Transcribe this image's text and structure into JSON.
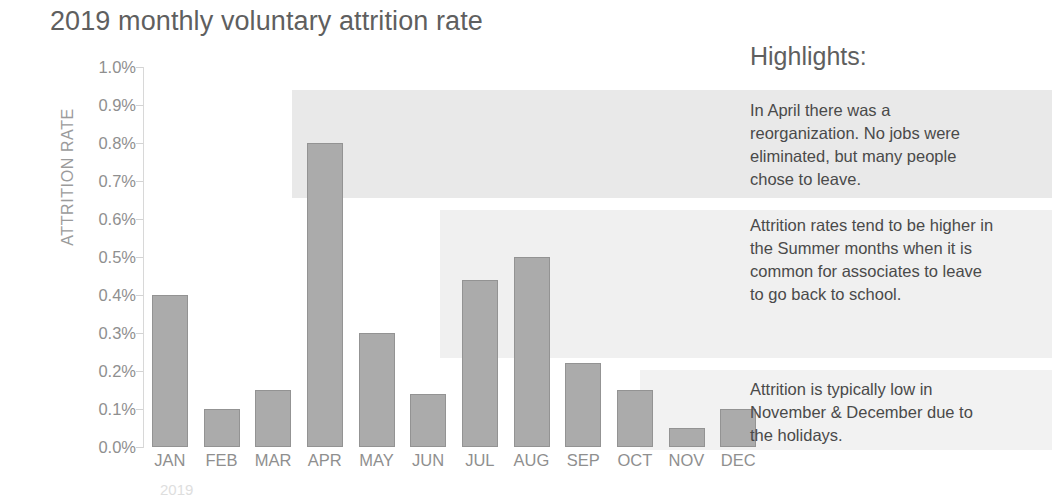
{
  "chart_data": {
    "type": "bar",
    "title": "2019 monthly voluntary attrition rate",
    "xlabel": "",
    "ylabel": "ATTRITION RATE",
    "categories": [
      "JAN",
      "FEB",
      "MAR",
      "APR",
      "MAY",
      "JUN",
      "JUL",
      "AUG",
      "SEP",
      "OCT",
      "NOV",
      "DEC"
    ],
    "values": [
      0.4,
      0.1,
      0.15,
      0.8,
      0.3,
      0.14,
      0.44,
      0.5,
      0.22,
      0.15,
      0.05,
      0.1
    ],
    "value_unit": "%",
    "ylim": [
      0.0,
      1.0
    ],
    "ytick_labels": [
      "1.0%",
      "0.9%",
      "0.8%",
      "0.7%",
      "0.6%",
      "0.5%",
      "0.4%",
      "0.3%",
      "0.2%",
      "0.1%",
      "0.0%"
    ],
    "ytick_values": [
      1.0,
      0.9,
      0.8,
      0.7,
      0.6,
      0.5,
      0.4,
      0.3,
      0.2,
      0.1,
      0.0
    ],
    "grid": false,
    "legend": false,
    "bar_color": "#ababab",
    "bar_border_color": "#939393",
    "footnote": "2019"
  },
  "highlights": {
    "title": "Highlights:",
    "items": [
      {
        "text": "In April there was a reorganization. No jobs were eliminated, but many people chose to leave.",
        "band_color": "#e9e9e9"
      },
      {
        "text": "Attrition rates tend to be higher in the Summer months when it is common for associates to leave to go back to school.",
        "band_color": "#f0f0f0"
      },
      {
        "text": "Attrition is typically low in November & December due to the holidays.",
        "band_color": "#f2f2f2"
      }
    ]
  },
  "colors": {
    "title_text": "#5f5f5f",
    "axis_text": "#8f8f8f",
    "body_text": "#4a4a4a",
    "background": "#ffffff"
  }
}
